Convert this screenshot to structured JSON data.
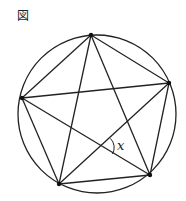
{
  "figure": {
    "header_label": "図",
    "angle_label": "x",
    "stroke_color": "#222222",
    "circle": {
      "cx": 97,
      "cy": 114,
      "r": 79
    },
    "vertices": {
      "top": [
        91,
        35
      ],
      "right": [
        169,
        83
      ],
      "bottom_right": [
        150,
        175
      ],
      "bottom_left": [
        59,
        184
      ],
      "left": [
        22,
        98
      ]
    },
    "pentagon_edges": [
      [
        "top",
        "right"
      ],
      [
        "right",
        "bottom_right"
      ],
      [
        "bottom_right",
        "bottom_left"
      ],
      [
        "bottom_left",
        "left"
      ],
      [
        "left",
        "top"
      ]
    ],
    "star_diagonals": [
      [
        "top",
        "bottom_left"
      ],
      [
        "top",
        "bottom_right"
      ],
      [
        "left",
        "right"
      ],
      [
        "left",
        "bottom_right"
      ],
      [
        "bottom_left",
        "right"
      ]
    ],
    "marked_angle": {
      "at_intersection_of": [
        [
          "left",
          "bottom_right"
        ],
        [
          "bottom_left",
          "right"
        ]
      ],
      "label": "x"
    }
  }
}
